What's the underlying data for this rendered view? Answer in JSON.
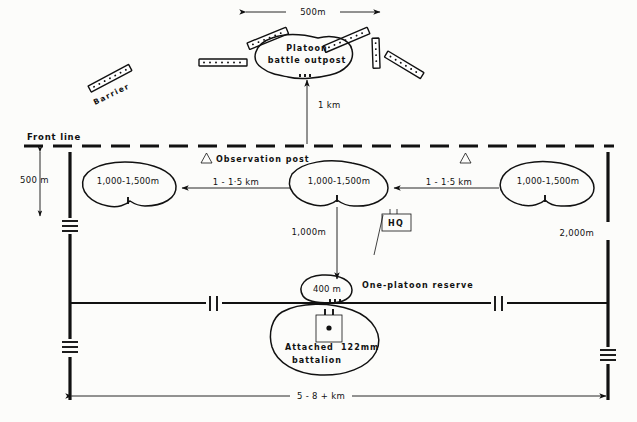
{
  "diagram": {
    "background_color": "#fcfcfa",
    "ink_color": "#111111"
  },
  "labels": {
    "front_line": "Front line",
    "observation_post": "Observation post",
    "platoon_outpost_line1": "Platoon",
    "platoon_outpost_line2": "battle outpost",
    "barrier": "Barrier",
    "one_platoon_reserve": "One-platoon reserve",
    "hq": "HQ",
    "attached_line1": "Attached",
    "attached_line2": "battalion",
    "artillery_caliber": "122mm"
  },
  "dimensions": {
    "outpost_width": "500m",
    "outpost_depth": "1 km",
    "front_setback": "500 m",
    "platoon_left": "1,000-1,500m",
    "platoon_center": "1,000-1,500m",
    "platoon_right": "1,000-1,500m",
    "gap_left": "1 - 1·5 km",
    "gap_right": "1 - 1·5 km",
    "reserve_depth": "1,000m",
    "reserve_size": "400 m",
    "flank_depth": "2,000m",
    "frontage": "5 - 8 + km"
  },
  "symbols": [
    {
      "name": "observation-post-left",
      "glyph": "△"
    },
    {
      "name": "observation-post-right",
      "glyph": "△"
    },
    {
      "name": "hq-flag",
      "glyph": "HQ"
    },
    {
      "name": "artillery-battery",
      "glyph": "●"
    }
  ],
  "barriers": [
    {
      "name": "barrier-far-left",
      "angle": -28
    },
    {
      "name": "barrier-upper-left",
      "angle": -20
    },
    {
      "name": "barrier-left-horizontal",
      "angle": 0
    },
    {
      "name": "barrier-center-left",
      "angle": -24
    },
    {
      "name": "barrier-center-right",
      "angle": -22
    },
    {
      "name": "barrier-right-vertical",
      "angle": 90
    },
    {
      "name": "barrier-far-right",
      "angle": 32
    }
  ]
}
